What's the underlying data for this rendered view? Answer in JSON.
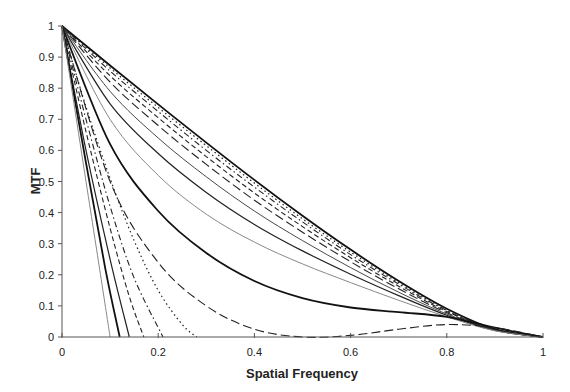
{
  "chart_data": {
    "type": "line",
    "title": "",
    "xlabel": "Spatial Frequency",
    "ylabel": "MTF",
    "xlim": [
      0,
      1
    ],
    "ylim": [
      0,
      1
    ],
    "grid": false,
    "legend": "none",
    "x_ticks": [
      "0",
      "0.2",
      "0.4",
      "0.6",
      "0.8",
      "1"
    ],
    "y_ticks": [
      "0",
      "0.1",
      "0.2",
      "0.3",
      "0.4",
      "0.5",
      "0.6",
      "0.7",
      "0.8",
      "0.9",
      "1"
    ],
    "series": [
      {
        "name": "curve-1",
        "style": "solid-thick",
        "color": "#111111",
        "x": [
          0,
          0.1,
          0.2,
          0.3,
          0.4,
          0.5,
          0.6,
          0.7,
          0.8,
          0.9,
          1.0
        ],
        "y": [
          1,
          0.873,
          0.748,
          0.625,
          0.505,
          0.39,
          0.281,
          0.18,
          0.091,
          0.025,
          0
        ]
      },
      {
        "name": "curve-2",
        "style": "dotted",
        "color": "#222222",
        "x": [
          0,
          0.1,
          0.2,
          0.3,
          0.4,
          0.5,
          0.6,
          0.7,
          0.8,
          0.9,
          1.0
        ],
        "y": [
          1,
          0.865,
          0.738,
          0.615,
          0.495,
          0.38,
          0.273,
          0.175,
          0.088,
          0.025,
          0
        ]
      },
      {
        "name": "curve-3",
        "style": "dash-dot",
        "color": "#222222",
        "x": [
          0,
          0.1,
          0.2,
          0.3,
          0.4,
          0.5,
          0.6,
          0.7,
          0.8,
          0.9,
          1.0
        ],
        "y": [
          1,
          0.855,
          0.725,
          0.6,
          0.482,
          0.37,
          0.265,
          0.17,
          0.085,
          0.024,
          0
        ]
      },
      {
        "name": "curve-4",
        "style": "dashed",
        "color": "#222222",
        "x": [
          0,
          0.1,
          0.2,
          0.3,
          0.4,
          0.5,
          0.6,
          0.7,
          0.8,
          0.9,
          1.0
        ],
        "y": [
          1,
          0.84,
          0.705,
          0.58,
          0.463,
          0.355,
          0.255,
          0.163,
          0.082,
          0.024,
          0
        ]
      },
      {
        "name": "curve-5",
        "style": "long-dash",
        "color": "#222222",
        "x": [
          0,
          0.1,
          0.2,
          0.3,
          0.4,
          0.5,
          0.6,
          0.7,
          0.8,
          0.9,
          1.0
        ],
        "y": [
          1,
          0.82,
          0.68,
          0.555,
          0.44,
          0.337,
          0.242,
          0.155,
          0.078,
          0.023,
          0
        ]
      },
      {
        "name": "curve-6",
        "style": "solid-thin",
        "color": "#333333",
        "x": [
          0,
          0.1,
          0.2,
          0.3,
          0.4,
          0.5,
          0.6,
          0.7,
          0.8,
          0.9,
          1.0
        ],
        "y": [
          1,
          0.79,
          0.64,
          0.515,
          0.405,
          0.31,
          0.223,
          0.144,
          0.074,
          0.022,
          0
        ]
      },
      {
        "name": "curve-7",
        "style": "solid",
        "color": "#222222",
        "x": [
          0,
          0.1,
          0.2,
          0.3,
          0.4,
          0.5,
          0.6,
          0.7,
          0.8,
          0.9,
          1.0
        ],
        "y": [
          1,
          0.75,
          0.59,
          0.465,
          0.362,
          0.277,
          0.202,
          0.133,
          0.07,
          0.021,
          0
        ]
      },
      {
        "name": "curve-8",
        "style": "solid-gray",
        "color": "#888888",
        "x": [
          0,
          0.1,
          0.2,
          0.3,
          0.4,
          0.5,
          0.6,
          0.7,
          0.8,
          0.9,
          1.0
        ],
        "y": [
          1,
          0.7,
          0.52,
          0.395,
          0.305,
          0.235,
          0.175,
          0.118,
          0.065,
          0.02,
          0
        ]
      },
      {
        "name": "curve-9",
        "style": "solid-thick",
        "color": "#111111",
        "x": [
          0,
          0.1,
          0.2,
          0.3,
          0.4,
          0.5,
          0.6,
          0.7,
          0.8,
          0.9,
          1.0
        ],
        "y": [
          1,
          0.62,
          0.405,
          0.27,
          0.18,
          0.125,
          0.095,
          0.08,
          0.065,
          0.03,
          0
        ]
      },
      {
        "name": "curve-10",
        "style": "long-dash",
        "color": "#222222",
        "x": [
          0,
          0.1,
          0.2,
          0.3,
          0.4,
          0.5,
          0.6,
          0.7,
          0.8,
          0.9,
          1.0
        ],
        "y": [
          1,
          0.5,
          0.24,
          0.1,
          0.025,
          0.0,
          0.005,
          0.025,
          0.04,
          0.03,
          0
        ]
      },
      {
        "name": "curve-11",
        "style": "dotted",
        "color": "#222222",
        "x": [
          0,
          0.05,
          0.1,
          0.15,
          0.2,
          0.25,
          0.28
        ],
        "y": [
          1,
          0.74,
          0.51,
          0.31,
          0.15,
          0.04,
          0
        ]
      },
      {
        "name": "curve-12",
        "style": "dash-dot",
        "color": "#222222",
        "x": [
          0,
          0.05,
          0.1,
          0.15,
          0.21
        ],
        "y": [
          1,
          0.7,
          0.42,
          0.19,
          0
        ]
      },
      {
        "name": "curve-13",
        "style": "dashed",
        "color": "#222222",
        "x": [
          0,
          0.05,
          0.1,
          0.14,
          0.17
        ],
        "y": [
          1,
          0.66,
          0.35,
          0.13,
          0
        ]
      },
      {
        "name": "curve-14",
        "style": "solid",
        "color": "#222222",
        "x": [
          0,
          0.05,
          0.1,
          0.14
        ],
        "y": [
          1,
          0.6,
          0.25,
          0
        ]
      },
      {
        "name": "curve-15",
        "style": "solid-thick",
        "color": "#111111",
        "x": [
          0,
          0.05,
          0.09,
          0.12
        ],
        "y": [
          1,
          0.56,
          0.22,
          0
        ]
      },
      {
        "name": "curve-16",
        "style": "solid-gray",
        "color": "#888888",
        "x": [
          0,
          0.05,
          0.08,
          0.1
        ],
        "y": [
          1,
          0.5,
          0.2,
          0
        ]
      }
    ],
    "tail_series_near_zero": "several dotted/dashed curves approach ~0.02-0.04 between x=0.7 and 1.0"
  }
}
